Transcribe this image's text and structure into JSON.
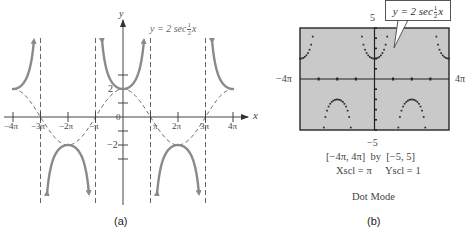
{
  "chart_data": [
    {
      "panel": "a",
      "type": "line",
      "caption": "(a)",
      "title": "y = 2 sec ½x",
      "function": "y = 2 sec(x/2)",
      "guide_function": "y = 2 cos(x/2)",
      "xlabel": "x",
      "ylabel": "y",
      "xlim": [
        -4.3,
        4.6
      ],
      "x_units": "pi",
      "ylim": [
        -6.2,
        7.2
      ],
      "x_ticks": [
        -4,
        -3,
        -2,
        -1,
        1,
        2,
        3,
        4
      ],
      "x_tick_labels": [
        "−4π",
        "−3π",
        "−2π",
        "−π",
        "π",
        "2π",
        "3π",
        "4π"
      ],
      "y_ticks": [
        -3,
        -2,
        -1,
        1,
        2,
        3
      ],
      "y_tick_labels": {
        "2": "2",
        "-2": "−2",
        "0": "0"
      },
      "asymptotes_x_pi": [
        -3,
        -1,
        1,
        3
      ],
      "branches": [
        {
          "x_from_pi": -4,
          "x_to_pi": -3.05,
          "direction": "up"
        },
        {
          "x_from_pi": -2.95,
          "x_to_pi": -1.05,
          "direction": "down"
        },
        {
          "x_from_pi": -0.95,
          "x_to_pi": 0.95,
          "direction": "up"
        },
        {
          "x_from_pi": 1.05,
          "x_to_pi": 2.95,
          "direction": "down"
        },
        {
          "x_from_pi": 3.05,
          "x_to_pi": 4,
          "direction": "up"
        }
      ],
      "key_points": [
        {
          "x": "-4π",
          "y": 2
        },
        {
          "x": "-2π",
          "y": -2
        },
        {
          "x": "0",
          "y": 2
        },
        {
          "x": "2π",
          "y": -2
        },
        {
          "x": "4π",
          "y": 2
        }
      ],
      "grid": false,
      "legend": "none"
    },
    {
      "panel": "b",
      "type": "scatter",
      "caption": "(b)",
      "mode": "Dot Mode",
      "function": "y = 2 sec(x/2)",
      "window_x": [
        "−4π",
        "4π"
      ],
      "window_y": [
        -5,
        5
      ],
      "xlim_pi": [
        -4,
        4
      ],
      "ylim": [
        -5,
        5
      ],
      "xscl": "π",
      "yscl": 1,
      "screen_color": "#c9c9c9",
      "dot_samples": 95
    }
  ],
  "panel_a": {
    "caption": "(a)",
    "equation": {
      "prefix": "y = 2 sec",
      "num": "1",
      "den": "2",
      "var": "x"
    },
    "axis_x_label": "x",
    "axis_y_label": "y",
    "x_tick_labels": [
      "−4π",
      "−3π",
      "−2π",
      "−π",
      "π",
      "2π",
      "3π",
      "4π"
    ],
    "origin_label": "0",
    "y2_label": "2",
    "ym2_label": "−2"
  },
  "panel_b": {
    "caption": "(b)",
    "callout": {
      "prefix": "y = 2 sec",
      "num": "1",
      "den": "2",
      "var": "x"
    },
    "ymax_label": "5",
    "ymin_label": "−5",
    "xmin_label": "−4π",
    "xmax_label": "4π",
    "window_line": "[−4π, 4π]  by  [−5, 5]",
    "xscl_label": "Xscl = π",
    "yscl_label": "Yscl = 1",
    "mode_label": "Dot Mode"
  },
  "colors": {
    "curve": "#8a8a8a",
    "dashed": "#555555",
    "axis": "#444444",
    "screen": "#c9c9c9",
    "screen_border": "#333333",
    "dots": "#2a2a2a"
  }
}
